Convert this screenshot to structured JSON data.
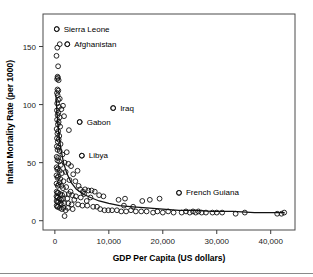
{
  "figure": {
    "cropped_caption_fragment": "·                                                                      ·    ·",
    "background_color": "#ffffff",
    "marker_color": "#111111",
    "line_color": "#111111"
  },
  "chart_data": {
    "type": "scatter",
    "title": "",
    "xlabel": "GDP Per Capita (US dollars)",
    "ylabel": "Infant Mortality Rate (per 1000)",
    "xlim": [
      -2200,
      44500
    ],
    "ylim": [
      -8,
      178
    ],
    "xticks": [
      0,
      10000,
      20000,
      30000,
      40000
    ],
    "xticklabels": [
      "0",
      "10,000",
      "20,000",
      "30,000",
      "40,000"
    ],
    "yticks": [
      0,
      50,
      100,
      150
    ],
    "yticklabels": [
      "0",
      "50",
      "100",
      "150"
    ],
    "grid": false,
    "legend": null,
    "marker": "open-circle",
    "points": [
      [
        350,
        165
      ],
      [
        900,
        152
      ],
      [
        450,
        149
      ],
      [
        300,
        142
      ],
      [
        600,
        133
      ],
      [
        2300,
        152
      ],
      [
        2600,
        78
      ],
      [
        500,
        124
      ],
      [
        560,
        123
      ],
      [
        420,
        122
      ],
      [
        700,
        121
      ],
      [
        480,
        113
      ],
      [
        640,
        112
      ],
      [
        390,
        110
      ],
      [
        900,
        105
      ],
      [
        1500,
        99
      ],
      [
        1200,
        96
      ],
      [
        1700,
        90
      ],
      [
        520,
        108
      ],
      [
        600,
        104
      ],
      [
        430,
        101
      ],
      [
        760,
        98
      ],
      [
        380,
        95
      ],
      [
        640,
        93
      ],
      [
        500,
        91
      ],
      [
        880,
        89
      ],
      [
        410,
        87
      ],
      [
        700,
        85
      ],
      [
        560,
        83
      ],
      [
        980,
        81
      ],
      [
        4600,
        85
      ],
      [
        10800,
        97
      ],
      [
        330,
        79
      ],
      [
        620,
        77
      ],
      [
        470,
        75
      ],
      [
        820,
        73
      ],
      [
        390,
        71
      ],
      [
        700,
        70
      ],
      [
        540,
        68
      ],
      [
        1050,
        66
      ],
      [
        360,
        64
      ],
      [
        660,
        63
      ],
      [
        490,
        61
      ],
      [
        900,
        60
      ],
      [
        2200,
        59
      ],
      [
        1400,
        57
      ],
      [
        5000,
        56
      ],
      [
        340,
        55
      ],
      [
        600,
        54
      ],
      [
        470,
        52
      ],
      [
        800,
        51
      ],
      [
        1800,
        50
      ],
      [
        2500,
        49
      ],
      [
        1100,
        48
      ],
      [
        3000,
        47
      ],
      [
        320,
        46
      ],
      [
        580,
        45
      ],
      [
        450,
        44
      ],
      [
        900,
        43
      ],
      [
        4200,
        43
      ],
      [
        2000,
        42
      ],
      [
        1300,
        41
      ],
      [
        3400,
        40
      ],
      [
        300,
        39
      ],
      [
        620,
        38
      ],
      [
        480,
        37
      ],
      [
        1000,
        36
      ],
      [
        2700,
        35
      ],
      [
        1600,
        34
      ],
      [
        3800,
        34
      ],
      [
        900,
        33
      ],
      [
        310,
        32
      ],
      [
        700,
        31
      ],
      [
        520,
        30
      ],
      [
        1200,
        30
      ],
      [
        2100,
        29
      ],
      [
        1500,
        28
      ],
      [
        4700,
        27
      ],
      [
        5600,
        27
      ],
      [
        6200,
        26
      ],
      [
        6800,
        26
      ],
      [
        7400,
        25
      ],
      [
        5200,
        25
      ],
      [
        330,
        25
      ],
      [
        620,
        24
      ],
      [
        480,
        24
      ],
      [
        980,
        23
      ],
      [
        1800,
        23
      ],
      [
        2600,
        23
      ],
      [
        1350,
        22
      ],
      [
        3200,
        22
      ],
      [
        8200,
        22
      ],
      [
        9000,
        21
      ],
      [
        23000,
        24
      ],
      [
        300,
        21
      ],
      [
        560,
        20
      ],
      [
        420,
        20
      ],
      [
        870,
        19
      ],
      [
        1500,
        19
      ],
      [
        2300,
        19
      ],
      [
        1150,
        18
      ],
      [
        3600,
        18
      ],
      [
        11800,
        18
      ],
      [
        13000,
        19
      ],
      [
        16200,
        17
      ],
      [
        17600,
        18
      ],
      [
        19400,
        19
      ],
      [
        320,
        17
      ],
      [
        640,
        16
      ],
      [
        470,
        16
      ],
      [
        1020,
        15
      ],
      [
        1700,
        15
      ],
      [
        2500,
        15
      ],
      [
        1250,
        14
      ],
      [
        3100,
        14
      ],
      [
        4300,
        14
      ],
      [
        5100,
        13
      ],
      [
        6000,
        13
      ],
      [
        7100,
        12
      ],
      [
        330,
        13
      ],
      [
        600,
        12
      ],
      [
        450,
        12
      ],
      [
        930,
        11
      ],
      [
        1600,
        11
      ],
      [
        2400,
        11
      ],
      [
        1300,
        10
      ],
      [
        3300,
        10
      ],
      [
        8400,
        10
      ],
      [
        9200,
        9
      ],
      [
        9900,
        9
      ],
      [
        10600,
        9
      ],
      [
        11500,
        9
      ],
      [
        12300,
        8
      ],
      [
        13200,
        8
      ],
      [
        14100,
        9
      ],
      [
        15000,
        8
      ],
      [
        16000,
        8
      ],
      [
        17000,
        8
      ],
      [
        18200,
        7
      ],
      [
        19000,
        8
      ],
      [
        20000,
        7
      ],
      [
        21000,
        8
      ],
      [
        22000,
        7
      ],
      [
        23500,
        7
      ],
      [
        24300,
        8
      ],
      [
        25000,
        7
      ],
      [
        25600,
        8
      ],
      [
        26100,
        7
      ],
      [
        26600,
        8
      ],
      [
        27200,
        7
      ],
      [
        28000,
        7
      ],
      [
        29200,
        7
      ],
      [
        30000,
        7
      ],
      [
        31000,
        7
      ],
      [
        33500,
        6
      ],
      [
        35200,
        7
      ],
      [
        41200,
        6
      ],
      [
        42000,
        6
      ],
      [
        42500,
        7
      ],
      [
        1800,
        4
      ],
      [
        2000,
        9
      ],
      [
        5900,
        17
      ],
      [
        7800,
        12
      ],
      [
        4800,
        20
      ],
      [
        3900,
        21
      ],
      [
        2900,
        25
      ],
      [
        4400,
        30
      ],
      [
        5400,
        23
      ],
      [
        6600,
        20
      ],
      [
        12800,
        13
      ],
      [
        14500,
        12
      ]
    ],
    "fit_curve": [
      [
        200,
        108
      ],
      [
        400,
        92
      ],
      [
        700,
        76
      ],
      [
        1100,
        62
      ],
      [
        1600,
        50
      ],
      [
        2200,
        41
      ],
      [
        3000,
        33
      ],
      [
        4000,
        27
      ],
      [
        5200,
        23
      ],
      [
        6600,
        20
      ],
      [
        8200,
        17
      ],
      [
        10000,
        15
      ],
      [
        12000,
        13
      ],
      [
        14500,
        12
      ],
      [
        17000,
        11
      ],
      [
        20000,
        10
      ],
      [
        23000,
        9
      ],
      [
        26000,
        9
      ],
      [
        29000,
        8
      ],
      [
        33000,
        8
      ],
      [
        37000,
        7
      ],
      [
        42500,
        7
      ]
    ],
    "annotations": [
      {
        "label": "Sierra Leone",
        "x": 350,
        "y": 165,
        "label_dx": 7,
        "label_dy": 2.5
      },
      {
        "label": "Afghanistan",
        "x": 2300,
        "y": 152,
        "label_dx": 7,
        "label_dy": 2.5
      },
      {
        "label": "Iraq",
        "x": 10800,
        "y": 97,
        "label_dx": 7,
        "label_dy": 2.5
      },
      {
        "label": "Gabon",
        "x": 4600,
        "y": 85,
        "label_dx": 7,
        "label_dy": 2.5
      },
      {
        "label": "Libya",
        "x": 5000,
        "y": 56,
        "label_dx": 7,
        "label_dy": 2.5
      },
      {
        "label": "French Guiana",
        "x": 23000,
        "y": 24,
        "label_dx": 7,
        "label_dy": 2.5
      }
    ]
  }
}
